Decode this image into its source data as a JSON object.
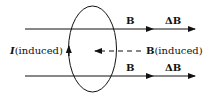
{
  "diagram": {
    "type": "induced-current-loop",
    "labels": {
      "top_B": "B",
      "top_dB": "ΔB",
      "bottom_B": "B",
      "bottom_dB": "ΔB",
      "current_I": "I",
      "current_suffix": "(induced)",
      "induced_B": "B",
      "induced_B_suffix": "(induced)"
    },
    "colors": {
      "stroke": "#111111",
      "background": "#ffffff"
    }
  }
}
